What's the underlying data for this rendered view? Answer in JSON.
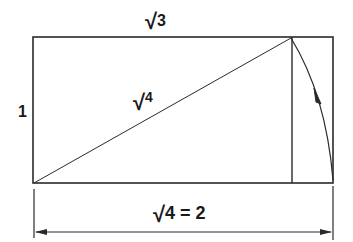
{
  "diagram": {
    "labels": {
      "top": {
        "radical": "√",
        "value": "3"
      },
      "left": "1",
      "diagonal": {
        "radical": "√",
        "value": "4"
      },
      "bottom": {
        "radical": "√",
        "value": "4 = 2"
      }
    },
    "colors": {
      "stroke": "#2a2a2a",
      "background": "#ffffff"
    },
    "geometry": {
      "outer_rect": {
        "x1": 33,
        "y1": 37,
        "x2": 333,
        "y2": 183
      },
      "inner_vertical_x": 291,
      "dimension_line_y": 232
    }
  }
}
